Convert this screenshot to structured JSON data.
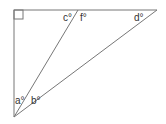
{
  "diagram": {
    "type": "right-triangle-with-cevian",
    "vertices": {
      "top_left": [
        14,
        10
      ],
      "top_right": [
        157,
        10
      ],
      "bottom_left": [
        14,
        117
      ],
      "cevian_top": [
        78,
        10
      ]
    },
    "right_angle_marker": "top-left",
    "line_color": "#777777",
    "labels": {
      "a": "a°",
      "b": "b°",
      "c": "c°",
      "d": "d°",
      "f": "f°"
    }
  }
}
